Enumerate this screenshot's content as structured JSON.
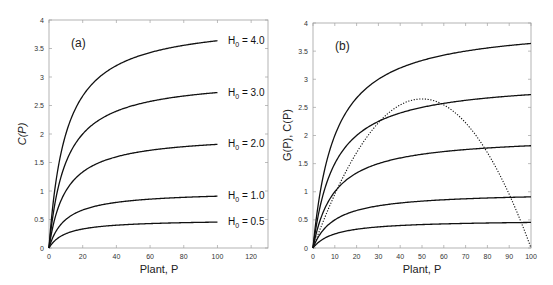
{
  "chart_data": [
    {
      "type": "line",
      "panel_label": "(a)",
      "xlabel": "Plant, P",
      "ylabel": "C(P)",
      "xlim": [
        0,
        130
      ],
      "ylim": [
        0,
        4
      ],
      "xticks": [
        0,
        20,
        40,
        60,
        80,
        100,
        120
      ],
      "yticks": [
        0,
        0.5,
        1,
        1.5,
        2,
        2.5,
        3,
        3.5,
        4
      ],
      "ytick_labels": [
        "0",
        "0.5",
        "1",
        "1.5",
        "2",
        "2.5",
        "3",
        "3.5",
        "4"
      ],
      "grid": false,
      "series": [
        {
          "name": "H0 = 4.0",
          "label": "H",
          "sub": "0",
          "value_text": " = 4.0",
          "H0": 4.0,
          "style": "solid"
        },
        {
          "name": "H0 = 3.0",
          "label": "H",
          "sub": "0",
          "value_text": " = 3.0",
          "H0": 3.0,
          "style": "solid"
        },
        {
          "name": "H0 = 2.0",
          "label": "H",
          "sub": "0",
          "value_text": " = 2.0",
          "H0": 2.0,
          "style": "solid"
        },
        {
          "name": "H0 = 1.0",
          "label": "H",
          "sub": "0",
          "value_text": " = 1.0",
          "H0": 1.0,
          "style": "solid"
        },
        {
          "name": "H0 = 0.5",
          "label": "H",
          "sub": "0",
          "value_text": " = 0.5",
          "H0": 0.5,
          "style": "solid"
        }
      ],
      "x": [
        0,
        1,
        2,
        5,
        10,
        20,
        30,
        40,
        50,
        60,
        70,
        80,
        90,
        100
      ],
      "approx_values": {
        "H0 = 4.0": [
          0,
          0.36,
          0.67,
          1.33,
          2.0,
          2.67,
          3.0,
          3.2,
          3.33,
          3.43,
          3.5,
          3.56,
          3.6,
          3.64
        ],
        "H0 = 3.0": [
          0,
          0.27,
          0.5,
          1.0,
          1.5,
          2.0,
          2.25,
          2.4,
          2.5,
          2.57,
          2.63,
          2.67,
          2.7,
          2.73
        ],
        "H0 = 2.0": [
          0,
          0.18,
          0.33,
          0.67,
          1.0,
          1.33,
          1.5,
          1.6,
          1.67,
          1.71,
          1.75,
          1.78,
          1.8,
          1.82
        ],
        "H0 = 1.0": [
          0,
          0.09,
          0.17,
          0.33,
          0.5,
          0.67,
          0.75,
          0.8,
          0.83,
          0.86,
          0.88,
          0.89,
          0.9,
          0.91
        ],
        "H0 = 0.5": [
          0,
          0.05,
          0.08,
          0.17,
          0.25,
          0.33,
          0.38,
          0.4,
          0.42,
          0.43,
          0.44,
          0.44,
          0.45,
          0.45
        ]
      },
      "model": {
        "form": "C(P) = H0 * P / (P + k)",
        "k": 10,
        "x_end": 100
      }
    },
    {
      "type": "line",
      "panel_label": "(b)",
      "xlabel": "Plant, P",
      "ylabel": "G(P),  C(P)",
      "xlim": [
        0,
        100
      ],
      "ylim": [
        0,
        4
      ],
      "xticks": [
        0,
        10,
        20,
        30,
        40,
        50,
        60,
        70,
        80,
        90,
        100
      ],
      "yticks": [
        0,
        0.5,
        1,
        1.5,
        2,
        2.5,
        3,
        3.5,
        4
      ],
      "ytick_labels": [
        "0",
        "0.5",
        "1",
        "1.5",
        "2",
        "2.5",
        "3",
        "3.5",
        "4"
      ],
      "grid": false,
      "series": [
        {
          "name": "C(P), H0 = 4.0",
          "H0": 4.0,
          "style": "solid"
        },
        {
          "name": "C(P), H0 = 3.0",
          "H0": 3.0,
          "style": "solid"
        },
        {
          "name": "C(P), H0 = 2.0",
          "H0": 2.0,
          "style": "solid"
        },
        {
          "name": "C(P), H0 = 1.0",
          "H0": 1.0,
          "style": "solid"
        },
        {
          "name": "C(P), H0 = 0.5",
          "H0": 0.5,
          "style": "solid"
        },
        {
          "name": "G(P)",
          "style": "dotted",
          "model": {
            "form": "G(P) = r * P * (1 - P/K)",
            "r": 0.106,
            "K": 100
          }
        }
      ],
      "x": [
        0,
        10,
        20,
        30,
        40,
        50,
        60,
        70,
        80,
        90,
        100
      ],
      "approx_values": {
        "G(P)": [
          0,
          0.95,
          1.7,
          2.23,
          2.54,
          2.65,
          2.54,
          2.23,
          1.7,
          0.95,
          0
        ]
      },
      "model": {
        "form": "C(P) = H0 * P / (P + k)",
        "k": 10,
        "x_end": 100
      }
    }
  ],
  "colors": {
    "line": "#111111",
    "axis": "#9a9a9a",
    "text": "#222222"
  }
}
